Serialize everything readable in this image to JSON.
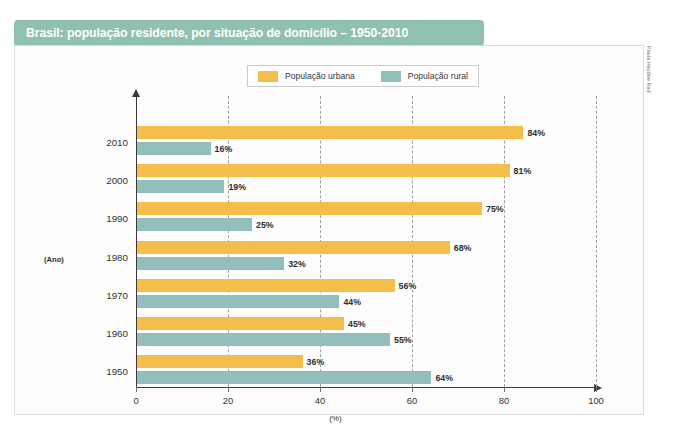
{
  "title": "Brasil: população residente, por situação de domicílio – 1950-2010",
  "credit": "Paula Haydee Rad",
  "colors": {
    "title_bar": "#8fc0b0",
    "urban": "#f5be4b",
    "rural": "#92bfbc",
    "axis": "#3a3a3a",
    "gridline": "#9aa0a4",
    "frame": "#d9dde0"
  },
  "legend": {
    "items": [
      {
        "label": "População urbana",
        "color": "#f5be4b",
        "key": "urbana"
      },
      {
        "label": "População rural",
        "color": "#92bfbc",
        "key": "rural"
      }
    ]
  },
  "axes": {
    "y_axis_name": "(Ano)",
    "x_axis_name": "(%)",
    "x_ticks": [
      "0",
      "20",
      "40",
      "60",
      "80",
      "100"
    ]
  },
  "chart_data": {
    "type": "bar",
    "orientation": "horizontal",
    "title": "Brasil: população residente, por situação de domicílio – 1950-2010",
    "xlabel": "(%)",
    "ylabel": "(Ano)",
    "xlim": [
      0,
      100
    ],
    "xticks": [
      0,
      20,
      40,
      60,
      80,
      100
    ],
    "grid": true,
    "legend_position": "top-center",
    "categories": [
      "2010",
      "2000",
      "1990",
      "1980",
      "1970",
      "1960",
      "1950"
    ],
    "series": [
      {
        "name": "População urbana",
        "color": "#f5be4b",
        "values": [
          84,
          81,
          75,
          68,
          56,
          45,
          36
        ],
        "labels": [
          "84%",
          "81%",
          "75%",
          "68%",
          "56%",
          "45%",
          "36%"
        ]
      },
      {
        "name": "População rural",
        "color": "#92bfbc",
        "values": [
          16,
          19,
          25,
          32,
          44,
          55,
          64
        ],
        "labels": [
          "16%",
          "19%",
          "25%",
          "32%",
          "44%",
          "55%",
          "64%"
        ]
      }
    ]
  }
}
